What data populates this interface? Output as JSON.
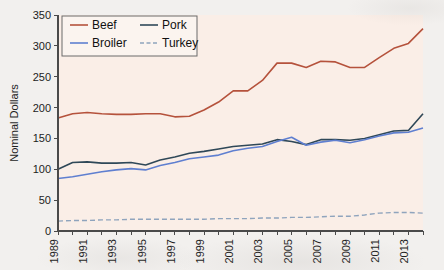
{
  "figure": {
    "background_color": "#f2f0ee",
    "plot_background_color": "#faeee7",
    "axis_color": "#4a4a4a"
  },
  "axes": {
    "ylabel": "Nominal Dollars",
    "xlabel": "",
    "y_ticks": [
      "0",
      "50",
      "100",
      "150",
      "200",
      "250",
      "300",
      "350"
    ],
    "x_ticks": [
      "1989",
      "1991",
      "1993",
      "1995",
      "1997",
      "1999",
      "2001",
      "2003",
      "2005",
      "2007",
      "2009",
      "2011",
      "2013"
    ]
  },
  "legend": {
    "position": "top-left",
    "entries": [
      {
        "label": "Beef",
        "color": "#b5523c",
        "style": "solid"
      },
      {
        "label": "Pork",
        "color": "#2f4858",
        "style": "solid"
      },
      {
        "label": "Broiler",
        "color": "#5f7fd0",
        "style": "solid"
      },
      {
        "label": "Turkey",
        "color": "#8fa4bd",
        "style": "dashed"
      }
    ]
  },
  "chart_data": {
    "type": "line",
    "title": "",
    "xlabel": "",
    "ylabel": "Nominal Dollars",
    "xlim": [
      1989,
      2014
    ],
    "ylim": [
      0,
      350
    ],
    "grid": false,
    "legend_position": "top-left",
    "x": [
      1989,
      1990,
      1991,
      1992,
      1993,
      1994,
      1995,
      1996,
      1997,
      1998,
      1999,
      2000,
      2001,
      2002,
      2003,
      2004,
      2005,
      2006,
      2007,
      2008,
      2009,
      2010,
      2011,
      2012,
      2013,
      2014
    ],
    "series": [
      {
        "name": "Beef",
        "color": "#b5523c",
        "style": "solid",
        "values": [
          183,
          190,
          192,
          190,
          189,
          189,
          190,
          190,
          185,
          186,
          196,
          209,
          227,
          227,
          244,
          272,
          272,
          265,
          275,
          274,
          265,
          265,
          281,
          296,
          304,
          328
        ]
      },
      {
        "name": "Pork",
        "color": "#2f4858",
        "style": "solid",
        "values": [
          100,
          111,
          112,
          110,
          110,
          111,
          107,
          115,
          120,
          126,
          129,
          133,
          137,
          139,
          141,
          148,
          145,
          140,
          148,
          148,
          147,
          150,
          156,
          162,
          163,
          190
        ]
      },
      {
        "name": "Broiler",
        "color": "#5f7fd0",
        "style": "solid",
        "values": [
          85,
          88,
          92,
          96,
          99,
          101,
          99,
          106,
          111,
          117,
          120,
          123,
          130,
          134,
          137,
          145,
          152,
          139,
          144,
          147,
          143,
          148,
          154,
          159,
          160,
          167
        ]
      },
      {
        "name": "Turkey",
        "color": "#8fa4bd",
        "style": "dashed",
        "values": [
          16,
          17,
          17,
          18,
          18,
          19,
          19,
          19,
          19,
          19,
          19,
          20,
          20,
          20,
          21,
          21,
          22,
          22,
          23,
          24,
          24,
          26,
          29,
          30,
          30,
          29
        ]
      }
    ]
  }
}
